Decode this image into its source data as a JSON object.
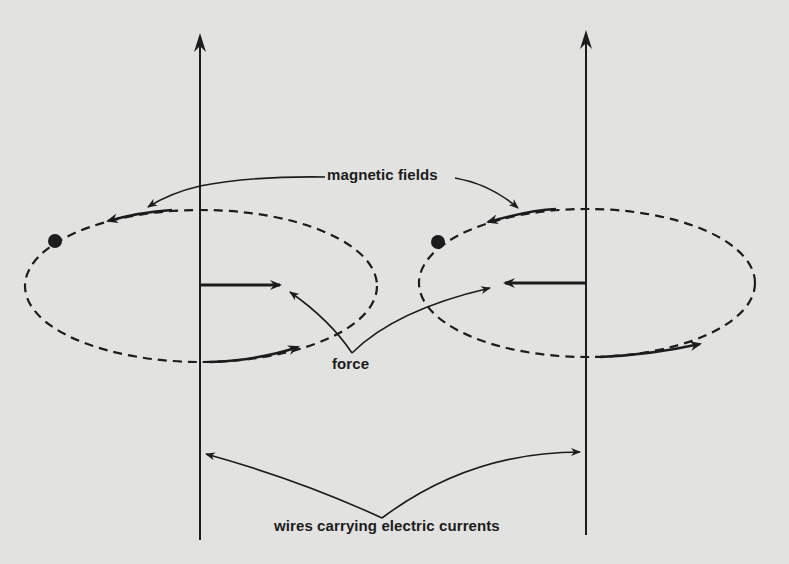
{
  "diagram": {
    "title": "",
    "labels": {
      "magnetic_fields": "magnetic fields",
      "force": "force",
      "wires": "wires carrying electric currents"
    },
    "wires": [
      {
        "id": "left-wire",
        "x": 200,
        "y_top": 33,
        "y_bottom": 540,
        "current_direction": "up"
      },
      {
        "id": "right-wire",
        "x": 586,
        "y_top": 30,
        "y_bottom": 535,
        "current_direction": "up"
      }
    ],
    "field_loops": [
      {
        "id": "left-field",
        "cx": 201,
        "cy": 286,
        "rx": 176,
        "ry": 76,
        "direction": "counterclockwise-top-view"
      },
      {
        "id": "right-field",
        "cx": 587,
        "cy": 283,
        "rx": 168,
        "ry": 74,
        "direction": "counterclockwise-top-view"
      }
    ],
    "forces": [
      {
        "id": "left-force",
        "from": [
          200,
          285
        ],
        "to": [
          280,
          285
        ],
        "direction": "toward right wire"
      },
      {
        "id": "right-force",
        "from": [
          586,
          283
        ],
        "to": [
          505,
          283
        ],
        "direction": "toward left wire"
      }
    ],
    "colors": {
      "background": "#e2e2e0",
      "ink": "#1c1c1c"
    }
  }
}
